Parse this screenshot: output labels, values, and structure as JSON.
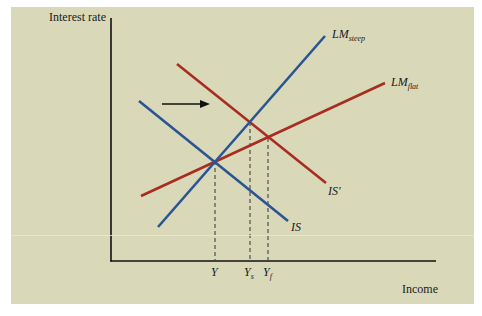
{
  "diagram": {
    "type": "IS-LM diagram",
    "axes": {
      "y_label": "Interest rate",
      "x_label": "Income"
    },
    "curves": {
      "lm_steep": {
        "label": "LM",
        "subscript": "steep",
        "color": "#2b5592"
      },
      "lm_flat": {
        "label": "LM",
        "subscript": "flat",
        "color": "#a82c20"
      },
      "is": {
        "label": "IS",
        "color": "#2b5592"
      },
      "is_prime": {
        "label": "IS'",
        "color": "#a82c20"
      }
    },
    "shift_arrow": {
      "direction": "right",
      "meaning": "IS shifts to IS'"
    },
    "ticks": [
      {
        "label": "Y",
        "subscript": ""
      },
      {
        "label": "Y",
        "subscript": "s"
      },
      {
        "label": "Y",
        "subscript": "f"
      }
    ],
    "colors": {
      "background": "#d9d9ba",
      "blue": "#2b5592",
      "red": "#a82c20",
      "axis": "#111111"
    }
  }
}
